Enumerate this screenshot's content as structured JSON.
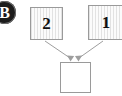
{
  "diagram": {
    "background_color": "#ffffff",
    "badge": {
      "label": "B",
      "icon_name": "step-badge-icon",
      "fill_color": "#1c1c1c",
      "text_color": "#ffffff"
    },
    "nodes": [
      {
        "id": "two",
        "label": "2",
        "style": "hatched",
        "border_color": "#9a9a9a",
        "fill_color": "#f3f3f3",
        "text_color": "#101010"
      },
      {
        "id": "one",
        "label": "1",
        "style": "hatched",
        "border_color": "#9a9a9a",
        "fill_color": "#f3f3f3",
        "text_color": "#101010"
      },
      {
        "id": "target",
        "label": "",
        "style": "plain",
        "border_color": "#9a9a9a",
        "fill_color": "#ffffff",
        "text_color": "#101010"
      }
    ],
    "edges": [
      {
        "from": "two",
        "to": "target",
        "arrowhead": true,
        "color": "#9e9e9e"
      },
      {
        "from": "one",
        "to": "target",
        "arrowhead": true,
        "color": "#9e9e9e"
      }
    ]
  }
}
